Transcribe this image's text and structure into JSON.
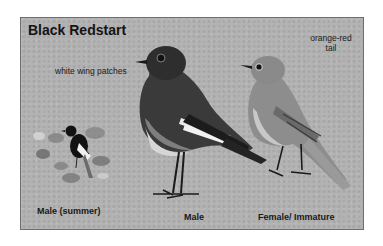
{
  "plate": {
    "title": "Black Redstart",
    "annotations": {
      "wing": "white wing patches",
      "tail_line1": "orange-red",
      "tail_line2": "tail"
    },
    "captions": {
      "summer_male": "Male (summer)",
      "male": "Male",
      "female": "Female/ Immature"
    },
    "colors": {
      "background": "#b3b3b3",
      "border": "#6e6e6e",
      "text": "#141414"
    }
  }
}
